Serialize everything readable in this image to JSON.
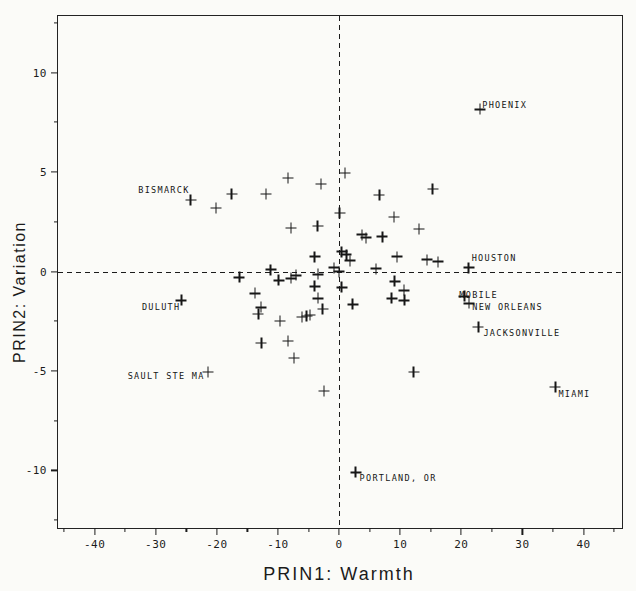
{
  "chart_data": {
    "type": "scatter",
    "title": "",
    "xlabel": "PRIN1: Warmth",
    "ylabel": "PRIN2: Variation",
    "xlim": [
      -46,
      46.3
    ],
    "ylim": [
      -12.89,
      12.84
    ],
    "x_major_ticks": [
      -40,
      -30,
      -20,
      -10,
      0,
      10,
      20,
      30,
      40
    ],
    "x_minor_ticks": [
      -45,
      -35,
      -25,
      -15,
      -5,
      5,
      15,
      25,
      35,
      45
    ],
    "y_major_ticks": [
      -10,
      -5,
      0,
      5,
      10
    ],
    "y_minor_ticks": [
      -12.5,
      -7.5,
      -2.5,
      2.5,
      7.5,
      12.5
    ],
    "grid": false,
    "legend": null,
    "marker_glyph": "+",
    "ink_color": "#1b1b1b",
    "paper_color": "#fbfbf8",
    "reference_lines": [
      {
        "axis": "x",
        "value": 0,
        "style": "dashed"
      },
      {
        "axis": "y",
        "value": 0,
        "style": "dashed"
      }
    ],
    "points": [
      {
        "x": -24.3,
        "y": 3.6,
        "label": "BISMARCK",
        "anchor": "end",
        "dx": -1,
        "dy": -14
      },
      {
        "x": -20.1,
        "y": 3.2
      },
      {
        "x": -17.6,
        "y": 3.9
      },
      {
        "x": -12.0,
        "y": 3.9
      },
      {
        "x": -8.4,
        "y": 4.7
      },
      {
        "x": -3.0,
        "y": 4.4
      },
      {
        "x": -7.9,
        "y": 2.2
      },
      {
        "x": -3.5,
        "y": 2.3
      },
      {
        "x": -4.0,
        "y": 0.75
      },
      {
        "x": -11.2,
        "y": 0.1
      },
      {
        "x": -16.3,
        "y": -0.3
      },
      {
        "x": 1.0,
        "y": 4.95
      },
      {
        "x": 6.6,
        "y": 3.85
      },
      {
        "x": 15.3,
        "y": 4.15
      },
      {
        "x": 0.1,
        "y": 2.95
      },
      {
        "x": 9.0,
        "y": 2.75
      },
      {
        "x": 13.1,
        "y": 2.15
      },
      {
        "x": 3.8,
        "y": 1.85
      },
      {
        "x": 4.4,
        "y": 1.7
      },
      {
        "x": 7.1,
        "y": 1.75
      },
      {
        "x": 9.5,
        "y": 0.75
      },
      {
        "x": 14.4,
        "y": 0.6
      },
      {
        "x": 16.2,
        "y": 0.5
      },
      {
        "x": 21.2,
        "y": 0.2,
        "label": "HOUSTON",
        "anchor": "start",
        "dx": 3,
        "dy": -14
      },
      {
        "x": 0.4,
        "y": 1.0
      },
      {
        "x": 1.2,
        "y": 0.85
      },
      {
        "x": 1.8,
        "y": 0.55
      },
      {
        "x": -0.8,
        "y": 0.2
      },
      {
        "x": 0.0,
        "y": 0.0
      },
      {
        "x": -3.4,
        "y": -0.15
      },
      {
        "x": 6.0,
        "y": 0.15
      },
      {
        "x": 0.4,
        "y": -0.8
      },
      {
        "x": -3.4,
        "y": -1.35
      },
      {
        "x": -2.7,
        "y": -1.9
      },
      {
        "x": 2.2,
        "y": -1.65
      },
      {
        "x": 9.1,
        "y": -0.5
      },
      {
        "x": 10.6,
        "y": -0.95
      },
      {
        "x": 8.6,
        "y": -1.35
      },
      {
        "x": 10.7,
        "y": -1.45
      },
      {
        "x": -9.9,
        "y": -0.45
      },
      {
        "x": -7.9,
        "y": -0.35
      },
      {
        "x": -7.0,
        "y": -0.2
      },
      {
        "x": -4.0,
        "y": -0.75
      },
      {
        "x": -13.8,
        "y": -1.1
      },
      {
        "x": -12.8,
        "y": -1.8
      },
      {
        "x": -13.2,
        "y": -2.15
      },
      {
        "x": -9.7,
        "y": -2.5
      },
      {
        "x": -6.1,
        "y": -2.3
      },
      {
        "x": -5.3,
        "y": -2.25
      },
      {
        "x": -4.8,
        "y": -2.2
      },
      {
        "x": -8.4,
        "y": -3.5
      },
      {
        "x": -12.7,
        "y": -3.6
      },
      {
        "x": -7.4,
        "y": -4.35
      },
      {
        "x": -2.5,
        "y": -6.0
      },
      {
        "x": 20.5,
        "y": -1.25,
        "label": "MOBILE",
        "anchor": "start",
        "dx": -5,
        "dy": -5
      },
      {
        "x": 21.3,
        "y": -1.6,
        "label": "NEW ORLEANS",
        "anchor": "start",
        "dx": 3,
        "dy": 0
      },
      {
        "x": 22.8,
        "y": -2.8,
        "label": "JACKSONVILLE",
        "anchor": "start",
        "dx": 5,
        "dy": 2
      },
      {
        "x": 12.2,
        "y": -5.05
      },
      {
        "x": 35.4,
        "y": -5.8,
        "label": "MIAMI",
        "anchor": "start",
        "dx": 3,
        "dy": 3
      },
      {
        "x": 2.7,
        "y": -10.1,
        "label": "PORTLAND, OR",
        "anchor": "start",
        "dx": 4,
        "dy": 2
      },
      {
        "x": 23.1,
        "y": 8.15,
        "label": "PHOENIX",
        "anchor": "start",
        "dx": 2,
        "dy": -8
      },
      {
        "x": -25.8,
        "y": -1.45,
        "label": "DULUTH",
        "anchor": "end",
        "dx": -1,
        "dy": 3
      },
      {
        "x": -21.5,
        "y": -5.05,
        "label": "SAULT STE MA",
        "anchor": "end",
        "dx": -3,
        "dy": 0
      }
    ]
  }
}
